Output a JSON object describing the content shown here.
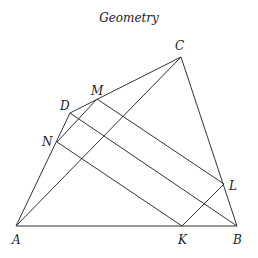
{
  "title": "Geometry",
  "points": {
    "A": {
      "label": "A"
    },
    "B": {
      "label": "B"
    },
    "C": {
      "label": "C"
    },
    "D": {
      "label": "D"
    },
    "M": {
      "label": "M"
    },
    "N": {
      "label": "N"
    },
    "K": {
      "label": "K"
    },
    "L": {
      "label": "L"
    }
  },
  "segments": [
    [
      "A",
      "B"
    ],
    [
      "A",
      "C"
    ],
    [
      "C",
      "B"
    ],
    [
      "A",
      "D"
    ],
    [
      "D",
      "C"
    ],
    [
      "D",
      "B"
    ],
    [
      "N",
      "M"
    ],
    [
      "M",
      "L"
    ],
    [
      "N",
      "K"
    ],
    [
      "K",
      "L"
    ]
  ]
}
